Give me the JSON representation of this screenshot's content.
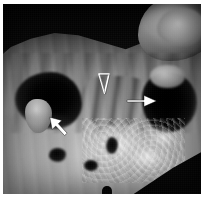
{
  "figure": {
    "kind": "grayscale-anatomical-specimen-photograph",
    "width_px": 205,
    "height_px": 204,
    "plate": {
      "left_px": 3,
      "top_px": 4,
      "width_px": 198,
      "height_px": 190,
      "background_color": "#ffffff",
      "dark_field_color": "#0a0a0a"
    }
  },
  "annotations": {
    "marker_color": "#ffffff",
    "outline_color": "#1a1a1a",
    "items": [
      {
        "id": "arrowhead-open-center",
        "glyph": "open-arrowhead-down",
        "style": "hollow-outline",
        "direction": "down",
        "x_pct": 51,
        "y_pct": 42,
        "size_px": 15
      },
      {
        "id": "arrow-solid-right",
        "glyph": "solid-arrow-right",
        "style": "solid-filled",
        "direction": "right",
        "x_pct": 70,
        "y_pct": 51,
        "size_px": 20
      },
      {
        "id": "arrow-solid-upleft",
        "glyph": "solid-arrow-up-left",
        "style": "solid-filled",
        "direction": "up-left",
        "x_pct": 28,
        "y_pct": 64,
        "size_px": 20
      }
    ]
  }
}
